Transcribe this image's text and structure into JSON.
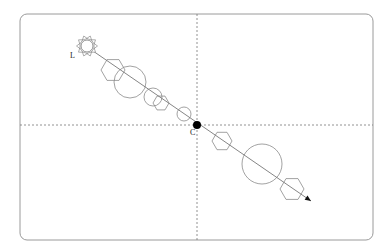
{
  "diagram": {
    "type": "lens-flare-diagram",
    "frame": {
      "x": 20,
      "y": 14,
      "width": 353,
      "height": 226,
      "radius": 7,
      "stroke": "#9a9a9a"
    },
    "axes": {
      "center_x": 197,
      "center_y": 125,
      "style": "dashed",
      "color": "#777777"
    },
    "light_source": {
      "label": "L",
      "x": 87,
      "y": 46,
      "radius": 6,
      "ray_count": 10,
      "icon": "sun-icon"
    },
    "center_point": {
      "label": "C",
      "x": 197,
      "y": 125,
      "radius": 4,
      "color": "#000000"
    },
    "flare_axis": {
      "x1": 93,
      "y1": 51,
      "x2": 311,
      "y2": 201,
      "color": "#777777",
      "arrow": "arrowhead"
    },
    "flare_elements": [
      {
        "shape": "hexagon",
        "cx": 113,
        "cy": 70,
        "r": 12
      },
      {
        "shape": "circle",
        "cx": 130,
        "cy": 82,
        "r": 16
      },
      {
        "shape": "circle",
        "cx": 153,
        "cy": 97,
        "r": 9
      },
      {
        "shape": "hexagon",
        "cx": 161,
        "cy": 103,
        "r": 8
      },
      {
        "shape": "circle",
        "cx": 184,
        "cy": 114,
        "r": 7
      },
      {
        "shape": "hexagon",
        "cx": 222,
        "cy": 141,
        "r": 10
      },
      {
        "shape": "circle",
        "cx": 262,
        "cy": 164,
        "r": 20
      },
      {
        "shape": "hexagon",
        "cx": 292,
        "cy": 189,
        "r": 12
      }
    ],
    "labels": {
      "light": "L",
      "center": "C"
    }
  }
}
